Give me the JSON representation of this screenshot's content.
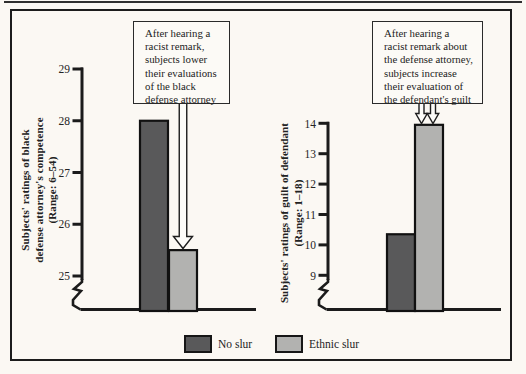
{
  "figure": {
    "background": "#fbf8f3",
    "frame_color": "#1c1c1c",
    "ink_color": "#1b1b1b"
  },
  "chart_data": [
    {
      "type": "bar",
      "title": "",
      "ylabel": "Subjects' ratings of black\ndefense attorney's competence\n(Range: 6–54)",
      "categories": [
        "No slur",
        "Ethnic slur"
      ],
      "values": [
        28,
        25.5
      ],
      "yticks": [
        25,
        26,
        27,
        28,
        29
      ],
      "ylim": [
        25,
        29
      ],
      "axis_break": true,
      "grid": false,
      "annotation": "After hearing a\nracist remark,\nsubjects lower\ntheir evaluations\nof the black\ndefense attorney"
    },
    {
      "type": "bar",
      "title": "",
      "ylabel": "Subjects' ratings of guilt of defendant\n(Range: 1–18)",
      "categories": [
        "No slur",
        "Ethnic slur"
      ],
      "values": [
        10.35,
        13.95
      ],
      "yticks": [
        9,
        10,
        11,
        12,
        13,
        14
      ],
      "ylim": [
        9,
        14
      ],
      "axis_break": true,
      "grid": false,
      "annotation": "After hearing a\nracist remark about\nthe defense attorney,\nsubjects increase\ntheir evaluation of\nthe defendant's guilt"
    }
  ],
  "legend": {
    "position": "bottom-center",
    "items": [
      {
        "label": "No slur",
        "color": "#59595a"
      },
      {
        "label": "Ethnic slur",
        "color": "#b2b2b0"
      }
    ]
  }
}
